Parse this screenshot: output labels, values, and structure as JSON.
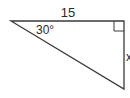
{
  "diagram": {
    "type": "right-triangle",
    "labels": {
      "top_side": "15",
      "angle": "30°",
      "right_side": "x"
    },
    "colors": {
      "stroke": "#3a3a3a",
      "text": "#2a2a2a",
      "background": "#ffffff"
    }
  }
}
